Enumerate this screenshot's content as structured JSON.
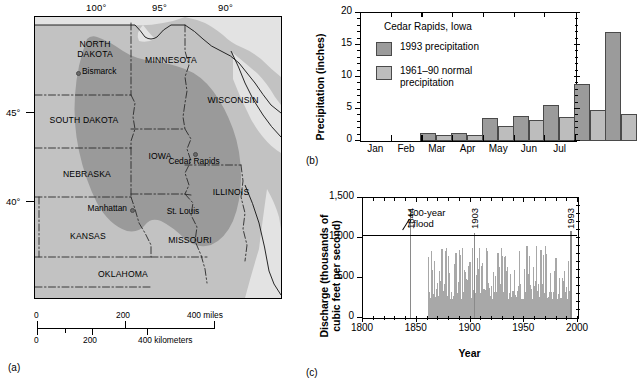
{
  "figure": {
    "panel_a_tag": "(a)",
    "panel_b_tag": "(b)",
    "panel_c_tag": "(c)"
  },
  "map": {
    "longitude_labels": [
      "100°",
      "95°",
      "90°"
    ],
    "latitude_labels": [
      "45°",
      "40°"
    ],
    "states": [
      {
        "name": "NORTH\nDAKOTA",
        "x": 28,
        "y": 22
      },
      {
        "name": "MINNESOTA",
        "x": 112,
        "y": 38
      },
      {
        "name": "WISCONSIN",
        "x": 178,
        "y": 78
      },
      {
        "name": "SOUTH DAKOTA",
        "x": 10,
        "y": 98
      },
      {
        "name": "IOWA",
        "x": 120,
        "y": 134
      },
      {
        "name": "NEBRASKA",
        "x": 24,
        "y": 152
      },
      {
        "name": "ILLINOIS",
        "x": 182,
        "y": 170
      },
      {
        "name": "KANSAS",
        "x": 32,
        "y": 214
      },
      {
        "name": "MISSOURI",
        "x": 140,
        "y": 218
      },
      {
        "name": "OKLAHOMA",
        "x": 62,
        "y": 252
      }
    ],
    "cities": [
      {
        "name": "Bismarck",
        "label_x": 36,
        "label_y": 52,
        "dot_x": 36,
        "dot_y": 55
      },
      {
        "name": "Cedar\nRapids",
        "label_x": 143,
        "label_y": 146,
        "dot_x": 157,
        "dot_y": 143
      },
      {
        "name": "Manhattan",
        "label_x": 36,
        "label_y": 190,
        "dot_x": 97,
        "dot_y": 193
      },
      {
        "name": "St. Louis",
        "label_x": 130,
        "label_y": 191,
        "dot_x": 0,
        "dot_y": 0
      }
    ],
    "scale_miles": {
      "ticks": [
        "0",
        "200",
        "400 miles"
      ]
    },
    "scale_km": {
      "ticks": [
        "0",
        "200",
        "400 kilometers"
      ]
    },
    "colors": {
      "flood_region": "#9a9a9a",
      "land": "#c2c2c2",
      "water": "#e8e8e8"
    }
  },
  "chart_data": [
    {
      "type": "bar",
      "panel": "(b)",
      "title": "Cedar Rapids, Iowa",
      "xlabel": "",
      "ylabel": "Precipitation (inches)",
      "ylim": [
        0,
        20
      ],
      "yticks": [
        0,
        5,
        10,
        15,
        20
      ],
      "categories": [
        "Jan",
        "Feb",
        "Mar",
        "Apr",
        "May",
        "Jun",
        "Jul"
      ],
      "series": [
        {
          "name": "1993 precipitation",
          "color": "#9b9b9b",
          "values": [
            1.2,
            1.3,
            3.6,
            3.9,
            5.6,
            8.9,
            17.1
          ]
        },
        {
          "name": "1961–90 normal\nprecipitation",
          "color": "#bdbdbd",
          "values": [
            1.0,
            1.0,
            2.3,
            3.3,
            3.8,
            4.8,
            4.2
          ]
        }
      ],
      "legend_position": "upper-left-inside",
      "grid": false
    },
    {
      "type": "bar",
      "panel": "(c)",
      "title": "",
      "xlabel": "Year",
      "ylabel": "Discharge (thousands of\ncubic feet per second)",
      "xlim": [
        1800,
        2000
      ],
      "ylim": [
        0,
        1500
      ],
      "yticks": [
        0,
        500,
        1000,
        1500
      ],
      "xticks": [
        1800,
        1850,
        1900,
        1950,
        2000
      ],
      "annotations": [
        {
          "text": "100-year\n/ flood",
          "value": 1030,
          "kind": "threshold-line"
        },
        {
          "text": "1844",
          "year": 1844,
          "peak": 1310
        },
        {
          "text": "1903",
          "year": 1903,
          "peak": 1060
        },
        {
          "text": "1993",
          "year": 1993,
          "peak": 1090
        }
      ],
      "record_start_year": 1860,
      "record_end_year": 1993,
      "typical_peak_range": [
        250,
        900
      ],
      "grid": false
    }
  ]
}
